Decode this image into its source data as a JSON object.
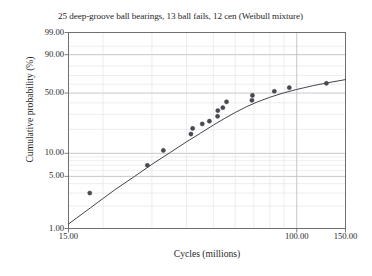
{
  "chart_data": {
    "type": "scatter",
    "title": "25 deep-groove ball bearings, 13 ball fails, 12 cen (Weibull mixture)",
    "xlabel": "Cycles (millions)",
    "ylabel": "Cumulative probability (%)",
    "xscale": "log",
    "yscale": "weibull-probability",
    "xlim": [
      15.0,
      150.0
    ],
    "ylim": [
      1.0,
      99.0
    ],
    "grid": true,
    "legend": "none",
    "xticks": [
      {
        "value": 15.0,
        "label": "15.00"
      },
      {
        "value": 100.0,
        "label": "100.00"
      },
      {
        "value": 150.0,
        "label": "150.00"
      }
    ],
    "yticks": [
      {
        "value": 1.0,
        "label": "1.00"
      },
      {
        "value": 5.0,
        "label": "5.00"
      },
      {
        "value": 10.0,
        "label": "10.00"
      },
      {
        "value": 50.0,
        "label": "50.00"
      },
      {
        "value": 90.0,
        "label": "90.00"
      },
      {
        "value": 99.0,
        "label": "99.00"
      }
    ],
    "x_gridlines": [
      20,
      30,
      40,
      50,
      60,
      70,
      80,
      90,
      100,
      150
    ],
    "y_gridlines": [
      2,
      3,
      4,
      5,
      6,
      7,
      8,
      9,
      10,
      20,
      30,
      40,
      50,
      60,
      70,
      80,
      90,
      95,
      99
    ],
    "series": [
      {
        "name": "Ball failures (empirical plotting positions)",
        "type": "scatter",
        "marker": "filled-circle",
        "color": "#4a4a52",
        "points": [
          {
            "x": 17.9,
            "y": 3.0
          },
          {
            "x": 28.9,
            "y": 7.0
          },
          {
            "x": 33.0,
            "y": 10.9
          },
          {
            "x": 41.5,
            "y": 17.5
          },
          {
            "x": 42.1,
            "y": 20.5
          },
          {
            "x": 45.6,
            "y": 23.2
          },
          {
            "x": 48.4,
            "y": 25.0
          },
          {
            "x": 51.8,
            "y": 28.5
          },
          {
            "x": 51.9,
            "y": 33.0
          },
          {
            "x": 54.1,
            "y": 35.5
          },
          {
            "x": 55.8,
            "y": 41.0
          },
          {
            "x": 68.9,
            "y": 42.5
          },
          {
            "x": 69.2,
            "y": 47.5
          },
          {
            "x": 83.0,
            "y": 52.0
          },
          {
            "x": 94.0,
            "y": 56.0
          },
          {
            "x": 128.0,
            "y": 61.0
          }
        ]
      },
      {
        "name": "Weibull mixture fit",
        "type": "line",
        "color": "#3a3a42",
        "points": [
          {
            "x": 15.0,
            "y": 1.15
          },
          {
            "x": 18.0,
            "y": 1.9
          },
          {
            "x": 22.0,
            "y": 3.3
          },
          {
            "x": 26.0,
            "y": 5.0
          },
          {
            "x": 30.0,
            "y": 7.2
          },
          {
            "x": 35.0,
            "y": 10.3
          },
          {
            "x": 40.0,
            "y": 14.0
          },
          {
            "x": 45.0,
            "y": 18.0
          },
          {
            "x": 50.0,
            "y": 22.5
          },
          {
            "x": 55.0,
            "y": 27.0
          },
          {
            "x": 60.0,
            "y": 31.5
          },
          {
            "x": 66.0,
            "y": 36.5
          },
          {
            "x": 72.0,
            "y": 40.8
          },
          {
            "x": 80.0,
            "y": 45.6
          },
          {
            "x": 90.0,
            "y": 50.3
          },
          {
            "x": 100.0,
            "y": 54.0
          },
          {
            "x": 115.0,
            "y": 58.4
          },
          {
            "x": 130.0,
            "y": 61.7
          },
          {
            "x": 150.0,
            "y": 65.2
          }
        ]
      }
    ]
  },
  "style": {
    "background": "#ffffff",
    "frame_color": "#6f6f6f",
    "major_grid_color": "#b9b9bd",
    "minor_grid_color": "#dedee2",
    "text_color": "#1f1f1f"
  }
}
